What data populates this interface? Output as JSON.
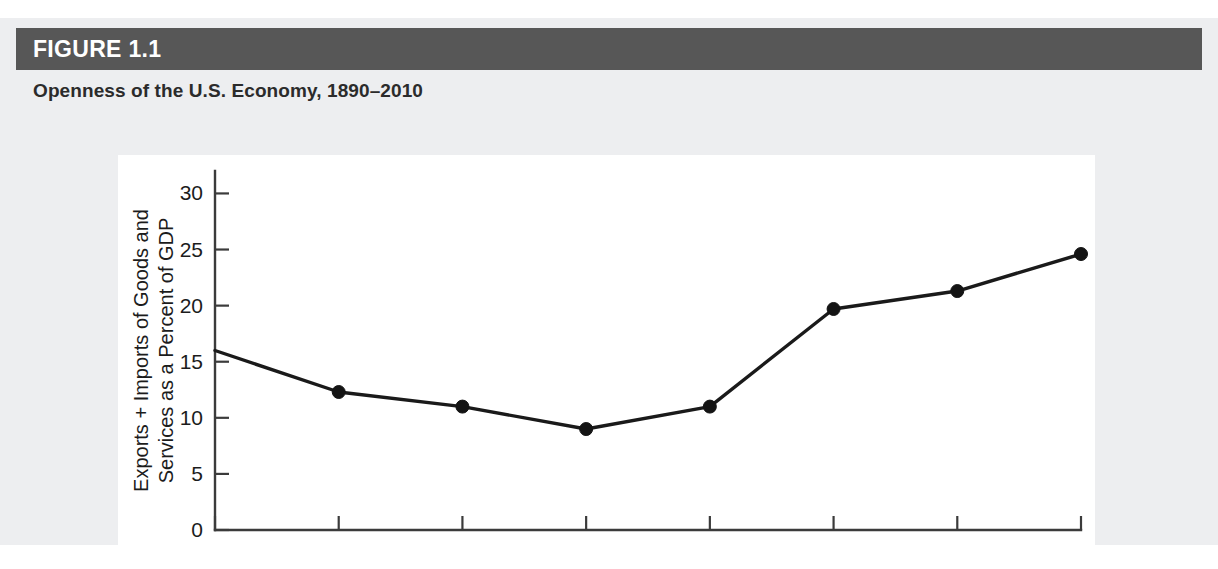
{
  "figure": {
    "number_label": "FIGURE 1.1",
    "title": "Openness of the U.S. Economy, 1890–2010",
    "header_bar_color": "#575757",
    "header_band_color": "#edeef0",
    "plot_background": "#ffffff",
    "line_color": "#1a1a1a"
  },
  "chart_data": {
    "type": "line",
    "title": "Openness of the U.S. Economy, 1890–2010",
    "xlabel": "",
    "ylabel": "Exports + Imports of Goods and Services as a Percent of GDP",
    "ylabel_line1": "Exports + Imports of Goods and",
    "ylabel_line2": "Services as a Percent of GDP",
    "categories": [
      "1890",
      "1910",
      "1930",
      "1950",
      "1970",
      "1990",
      "2000",
      "2010"
    ],
    "values": [
      16.0,
      12.3,
      11.0,
      9.0,
      11.0,
      19.7,
      21.3,
      24.6
    ],
    "x": [
      1890,
      1910,
      1930,
      1950,
      1970,
      1990,
      2000,
      2010
    ],
    "ylim": [
      0,
      32
    ],
    "yticks": [
      0,
      5,
      10,
      15,
      20,
      25,
      30
    ],
    "ytick_labels": [
      "0",
      "5",
      "10",
      "15",
      "20",
      "25",
      "30"
    ],
    "xtick_labels": [
      "1890",
      "1910",
      "1930",
      "1950",
      "1970",
      "1990",
      "2000",
      "2010"
    ],
    "grid": false,
    "legend": false,
    "markers": [
      false,
      true,
      true,
      true,
      true,
      true,
      true,
      true
    ],
    "series": [
      {
        "name": "Exports + Imports as a Percent of GDP",
        "values": [
          16.0,
          12.3,
          11.0,
          9.0,
          11.0,
          19.7,
          21.3,
          24.6
        ]
      }
    ]
  }
}
